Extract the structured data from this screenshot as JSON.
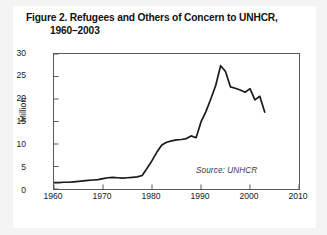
{
  "figure": {
    "title_line1": "Figure 2. Refugees and Others of Concern to UNHCR,",
    "title_line2": "1960–2003",
    "source_note": "Source: UNHCR"
  },
  "chart_data": {
    "type": "line",
    "title": "Figure 2. Refugees and Others of Concern to UNHCR, 1960–2003",
    "xlabel": "",
    "ylabel": "Million",
    "xlim": [
      1960,
      2010
    ],
    "ylim": [
      0,
      30
    ],
    "xticks": [
      1960,
      1970,
      1980,
      1990,
      2000,
      2010
    ],
    "yticks": [
      0,
      5,
      10,
      15,
      20,
      25,
      30
    ],
    "xtick_labels": [
      "1960",
      "1970",
      "1980",
      "1990",
      "2000",
      "2010"
    ],
    "ytick_labels": [
      "0",
      "5",
      "10",
      "15",
      "20",
      "25",
      "30"
    ],
    "grid": false,
    "legend": "none",
    "line_color": "#1a1a1a",
    "series": [
      {
        "name": "Refugees and others of concern to UNHCR",
        "units": "Million",
        "x": [
          1960,
          1961,
          1962,
          1963,
          1964,
          1965,
          1966,
          1967,
          1968,
          1969,
          1970,
          1971,
          1972,
          1973,
          1974,
          1975,
          1976,
          1977,
          1978,
          1979,
          1980,
          1981,
          1982,
          1983,
          1984,
          1985,
          1986,
          1987,
          1988,
          1989,
          1990,
          1991,
          1992,
          1993,
          1994,
          1995,
          1996,
          1997,
          1998,
          1999,
          2000,
          2001,
          2002,
          2003
        ],
        "values": [
          1.4,
          1.4,
          1.5,
          1.5,
          1.6,
          1.7,
          1.8,
          1.9,
          2.0,
          2.1,
          2.3,
          2.5,
          2.6,
          2.5,
          2.4,
          2.5,
          2.6,
          2.7,
          3.0,
          4.6,
          6.3,
          8.2,
          9.8,
          10.4,
          10.7,
          10.9,
          11.0,
          11.2,
          11.8,
          11.4,
          14.9,
          17.2,
          20.0,
          23.0,
          27.4,
          26.1,
          22.7,
          22.4,
          22.0,
          21.5,
          22.3,
          19.8,
          20.6,
          17.1
        ]
      }
    ]
  }
}
